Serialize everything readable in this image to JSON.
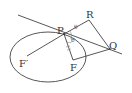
{
  "diagram": {
    "type": "ellipse-tangent-reflection",
    "colors": {
      "stroke": "#444444",
      "background": "#ffffff"
    },
    "labels": {
      "P": "P",
      "R": "R",
      "Q": "Q",
      "F": "F",
      "F_prime": "F′",
      "theta1": "θ",
      "theta2": "θ"
    },
    "points": {
      "P": [
        64,
        34
      ],
      "R": [
        89,
        20
      ],
      "Q": [
        110,
        49
      ],
      "F": [
        73,
        60
      ],
      "F_prime": [
        27,
        56
      ]
    },
    "ellipse": {
      "cx": 48,
      "cy": 57,
      "rx": 38,
      "ry": 25
    },
    "tangent_line": [
      [
        18,
        15
      ],
      [
        122,
        54
      ]
    ],
    "segments": [
      [
        "F_prime",
        "P"
      ],
      [
        "P",
        "R"
      ],
      [
        "R",
        "Q"
      ],
      [
        "P",
        "F"
      ],
      [
        "F",
        "Q"
      ]
    ]
  }
}
